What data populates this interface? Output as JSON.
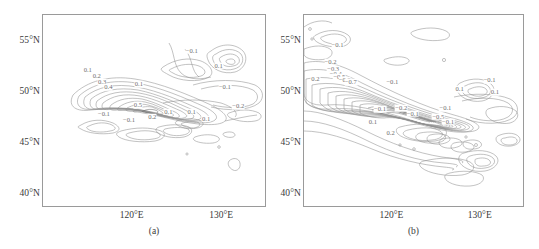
{
  "figure": {
    "background": "#ffffff",
    "contour_color": "#8f8f8f",
    "frame_color": "#9a9a9a",
    "label_color": "#3a3a3a"
  },
  "chart_data": [
    {
      "type": "contour",
      "title": "",
      "panel_label": "(a)",
      "xlabel": "",
      "ylabel": "",
      "xlim": [
        110,
        135
      ],
      "ylim": [
        38,
        57
      ],
      "grid": false,
      "legend": "none",
      "xticks": [
        120,
        130
      ],
      "xtick_labels": [
        "120°E",
        "130°E"
      ],
      "yticks": [
        40,
        45,
        50,
        55
      ],
      "ytick_labels": [
        "40°N",
        "45°N",
        "50°N",
        "55°N"
      ],
      "contour_interval": 0.1,
      "contour_levels": [
        -0.2,
        -0.1,
        0.1,
        0.2,
        0.3,
        0.4,
        0.5,
        0.6,
        0.7
      ],
      "max_value": 0.5,
      "min_value": -0.2,
      "inline_labels": [
        {
          "text": "0.1",
          "lon": 115.0,
          "lat": 51.6
        },
        {
          "text": "0.2",
          "lon": 116.0,
          "lat": 51.0
        },
        {
          "text": "0.3",
          "lon": 116.6,
          "lat": 50.4
        },
        {
          "text": "0.4",
          "lon": 117.3,
          "lat": 49.9
        },
        {
          "text": "0.5",
          "lon": 120.6,
          "lat": 48.1
        },
        {
          "text": "0.1",
          "lon": 120.7,
          "lat": 50.2
        },
        {
          "text": "−0.1",
          "lon": 116.8,
          "lat": 47.3
        },
        {
          "text": "−0.1",
          "lon": 119.6,
          "lat": 46.7
        },
        {
          "text": "−0.1",
          "lon": 126.6,
          "lat": 53.5
        },
        {
          "text": "0.1",
          "lon": 129.6,
          "lat": 52.0
        },
        {
          "text": "−0.1",
          "lon": 130.3,
          "lat": 49.9
        },
        {
          "text": "−0.2",
          "lon": 131.8,
          "lat": 48.0
        },
        {
          "text": "0.2",
          "lon": 122.2,
          "lat": 47.0
        },
        {
          "text": "0.1",
          "lon": 124.0,
          "lat": 47.5
        },
        {
          "text": "0.1",
          "lon": 126.6,
          "lat": 47.5
        },
        {
          "text": "0.1",
          "lon": 128.2,
          "lat": 46.8
        }
      ]
    },
    {
      "type": "contour",
      "title": "",
      "panel_label": "(b)",
      "xlabel": "",
      "ylabel": "",
      "xlim": [
        110,
        135
      ],
      "ylim": [
        38,
        57
      ],
      "grid": false,
      "legend": "none",
      "xticks": [
        120,
        130
      ],
      "xtick_labels": [
        "120°E",
        "130°E"
      ],
      "yticks": [
        40,
        45,
        50,
        55
      ],
      "ytick_labels": [
        "40°N",
        "45°N",
        "50°N",
        "55°N"
      ],
      "contour_interval": 0.1,
      "contour_levels": [
        -0.7,
        -0.6,
        -0.5,
        -0.4,
        -0.3,
        -0.2,
        -0.1,
        0.1,
        0.2
      ],
      "max_value": 0.2,
      "min_value": -0.7,
      "inline_labels": [
        {
          "text": "−0.1",
          "lon": 113.8,
          "lat": 54.0
        },
        {
          "text": "−0.2",
          "lon": 113.0,
          "lat": 52.4
        },
        {
          "text": "−0.3",
          "lon": 113.3,
          "lat": 51.7
        },
        {
          "text": "−0.4",
          "lon": 113.6,
          "lat": 51.2
        },
        {
          "text": "−0.5",
          "lon": 114.0,
          "lat": 50.9
        },
        {
          "text": "−0.6",
          "lon": 114.6,
          "lat": 50.6
        },
        {
          "text": "−0.7",
          "lon": 115.3,
          "lat": 50.4
        },
        {
          "text": "0.2",
          "lon": 111.3,
          "lat": 50.7
        },
        {
          "text": "−0.1",
          "lon": 120.0,
          "lat": 50.4
        },
        {
          "text": "−0.1",
          "lon": 131.0,
          "lat": 50.6
        },
        {
          "text": "0.1",
          "lon": 127.6,
          "lat": 49.7
        },
        {
          "text": "0.1",
          "lon": 131.6,
          "lat": 49.4
        },
        {
          "text": "−0.1",
          "lon": 118.6,
          "lat": 47.7
        },
        {
          "text": "−0.2",
          "lon": 121.0,
          "lat": 47.8
        },
        {
          "text": "−0.1",
          "lon": 126.0,
          "lat": 47.8
        },
        {
          "text": "−0.1",
          "lon": 122.3,
          "lat": 47.3
        },
        {
          "text": "−0.5",
          "lon": 125.2,
          "lat": 47.0
        },
        {
          "text": "−0.1",
          "lon": 126.3,
          "lat": 46.5
        },
        {
          "text": "0.1",
          "lon": 117.8,
          "lat": 46.5
        },
        {
          "text": "0.2",
          "lon": 119.8,
          "lat": 45.4
        }
      ]
    }
  ]
}
